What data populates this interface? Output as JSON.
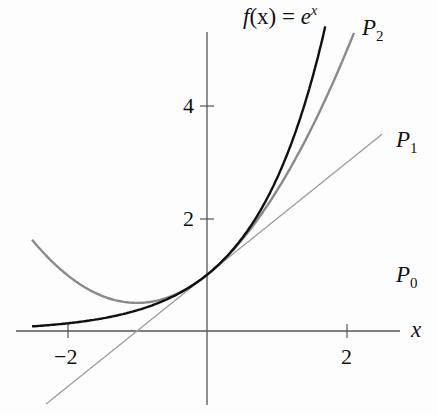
{
  "chart_data": {
    "type": "line",
    "title": "",
    "xlabel": "x",
    "ylabel": "",
    "xlim": [
      -2.5,
      2.6
    ],
    "ylim": [
      -1.3,
      5.4
    ],
    "x_ticks": [
      -2,
      2
    ],
    "x_tick_labels": [
      "−2",
      "2"
    ],
    "y_ticks": [
      2,
      4
    ],
    "y_tick_labels": [
      "2",
      "4"
    ],
    "grid": false,
    "legend": "inline curve labels",
    "series": [
      {
        "name": "f(x) = e^x",
        "formula": "exp(x)",
        "color": "#111111",
        "x_range": [
          -2.5,
          1.69
        ],
        "points": [
          [
            -2.5,
            0.08
          ],
          [
            -2,
            0.14
          ],
          [
            -1,
            0.37
          ],
          [
            0,
            1
          ],
          [
            1,
            2.72
          ],
          [
            1.5,
            4.48
          ],
          [
            1.69,
            5.42
          ]
        ]
      },
      {
        "name": "P2",
        "formula": "1 + x + x^2/2",
        "color": "#888888",
        "x_range": [
          -2.5,
          2.1
        ],
        "points": [
          [
            -2.5,
            1.63
          ],
          [
            -2,
            1
          ],
          [
            -1,
            0.5
          ],
          [
            0,
            1
          ],
          [
            1,
            2.5
          ],
          [
            2,
            5
          ],
          [
            2.1,
            5.31
          ]
        ]
      },
      {
        "name": "P1",
        "formula": "1 + x",
        "color": "#999999",
        "x_range": [
          -2.3,
          2.5
        ],
        "points": [
          [
            -2.3,
            -1.3
          ],
          [
            -1,
            0
          ],
          [
            0,
            1
          ],
          [
            1,
            2
          ],
          [
            2,
            3
          ],
          [
            2.5,
            3.5
          ]
        ]
      },
      {
        "name": "P0",
        "formula": "1",
        "color": "#999999",
        "note": "label only, line coincides visually near y=1"
      }
    ],
    "annotations": [
      "f(x) = e^x",
      "P2",
      "P1",
      "P0"
    ]
  },
  "labels": {
    "title_f": "f",
    "title_rest": "(x) = ",
    "title_e": "e",
    "title_x": "x",
    "x_axis": "x",
    "xtick_neg2": "−2",
    "xtick_2": "2",
    "ytick_2": "2",
    "ytick_4": "4",
    "p2": "P",
    "p2_sub": "2",
    "p1": "P",
    "p1_sub": "1",
    "p0": "P",
    "p0_sub": "0"
  }
}
